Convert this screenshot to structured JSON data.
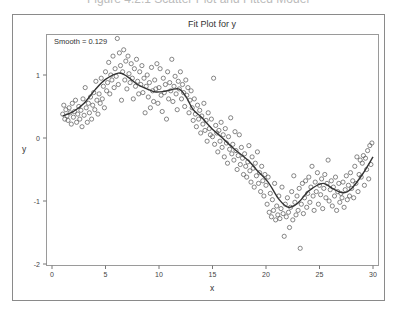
{
  "caption": "Figure 4.2.1 Scatter Plot and Fitted Model",
  "chart_data": {
    "type": "scatter",
    "title": "Fit Plot for y",
    "xlabel": "x",
    "ylabel": "y",
    "annotation": "Smooth = 0.129",
    "xlim": [
      0,
      30
    ],
    "ylim": [
      -2,
      1.6
    ],
    "xticks": [
      0,
      5,
      10,
      15,
      20,
      25,
      30
    ],
    "yticks": [
      -2,
      -1,
      0,
      1
    ],
    "grid": false,
    "legend": "none",
    "series": [
      {
        "name": "Observed",
        "type": "scatter",
        "marker": "open-circle",
        "points": [
          [
            1.0,
            0.38
          ],
          [
            1.1,
            0.52
          ],
          [
            1.2,
            0.3
          ],
          [
            1.3,
            0.45
          ],
          [
            1.4,
            0.35
          ],
          [
            1.5,
            0.28
          ],
          [
            1.6,
            0.48
          ],
          [
            1.7,
            0.4
          ],
          [
            1.8,
            0.22
          ],
          [
            1.9,
            0.55
          ],
          [
            2.0,
            0.33
          ],
          [
            2.1,
            0.42
          ],
          [
            2.2,
            0.6
          ],
          [
            2.3,
            0.25
          ],
          [
            2.4,
            0.38
          ],
          [
            2.5,
            0.5
          ],
          [
            2.6,
            0.3
          ],
          [
            2.7,
            0.44
          ],
          [
            2.8,
            0.18
          ],
          [
            2.9,
            0.62
          ],
          [
            3.0,
            0.36
          ],
          [
            3.1,
            0.8
          ],
          [
            3.2,
            0.48
          ],
          [
            3.3,
            0.25
          ],
          [
            3.4,
            0.55
          ],
          [
            3.5,
            0.4
          ],
          [
            3.6,
            0.65
          ],
          [
            3.7,
            0.3
          ],
          [
            3.8,
            0.52
          ],
          [
            3.9,
            0.72
          ],
          [
            4.0,
            0.45
          ],
          [
            4.1,
            0.9
          ],
          [
            4.2,
            0.6
          ],
          [
            4.3,
            0.38
          ],
          [
            4.4,
            0.7
          ],
          [
            4.5,
            0.55
          ],
          [
            4.6,
            0.95
          ],
          [
            4.7,
            0.62
          ],
          [
            4.8,
            0.82
          ],
          [
            4.9,
            0.48
          ],
          [
            5.0,
            1.05
          ],
          [
            5.1,
            0.75
          ],
          [
            5.2,
            0.88
          ],
          [
            5.3,
            1.2
          ],
          [
            5.4,
            0.7
          ],
          [
            5.5,
            1.0
          ],
          [
            5.6,
            0.92
          ],
          [
            5.7,
            1.3
          ],
          [
            5.8,
            0.8
          ],
          [
            5.9,
            1.1
          ],
          [
            6.0,
            0.98
          ],
          [
            6.1,
            1.58
          ],
          [
            6.2,
            0.85
          ],
          [
            6.3,
            1.35
          ],
          [
            6.4,
            1.15
          ],
          [
            6.5,
            0.6
          ],
          [
            6.6,
            1.05
          ],
          [
            6.7,
            1.4
          ],
          [
            6.8,
            0.92
          ],
          [
            6.9,
            1.22
          ],
          [
            7.0,
            0.78
          ],
          [
            7.1,
            1.3
          ],
          [
            7.2,
            1.02
          ],
          [
            7.3,
            0.88
          ],
          [
            7.4,
            1.18
          ],
          [
            7.5,
            0.95
          ],
          [
            7.6,
            0.62
          ],
          [
            7.7,
            1.1
          ],
          [
            7.8,
            0.82
          ],
          [
            7.9,
            1.25
          ],
          [
            8.0,
            0.9
          ],
          [
            8.1,
            0.7
          ],
          [
            8.2,
            1.05
          ],
          [
            8.3,
            0.85
          ],
          [
            8.4,
            1.15
          ],
          [
            8.5,
            0.72
          ],
          [
            8.6,
            0.95
          ],
          [
            8.7,
            0.4
          ],
          [
            8.8,
            0.82
          ],
          [
            8.9,
            1.0
          ],
          [
            9.0,
            0.65
          ],
          [
            9.1,
            0.88
          ],
          [
            9.2,
            0.48
          ],
          [
            9.3,
            1.12
          ],
          [
            9.4,
            0.75
          ],
          [
            9.5,
            0.58
          ],
          [
            9.6,
            0.92
          ],
          [
            9.7,
            0.78
          ],
          [
            9.8,
            1.18
          ],
          [
            9.9,
            0.55
          ],
          [
            10.0,
            0.8
          ],
          [
            10.1,
            1.1
          ],
          [
            10.2,
            0.68
          ],
          [
            10.3,
            0.42
          ],
          [
            10.4,
            0.95
          ],
          [
            10.5,
            0.72
          ],
          [
            10.6,
            0.85
          ],
          [
            10.7,
            0.3
          ],
          [
            10.8,
            1.05
          ],
          [
            10.9,
            0.62
          ],
          [
            11.0,
            0.88
          ],
          [
            11.1,
            0.75
          ],
          [
            11.2,
            1.25
          ],
          [
            11.3,
            0.58
          ],
          [
            11.4,
            0.82
          ],
          [
            11.5,
            0.98
          ],
          [
            11.6,
            0.7
          ],
          [
            11.7,
            0.45
          ],
          [
            11.8,
            0.9
          ],
          [
            11.9,
            0.78
          ],
          [
            12.0,
            1.05
          ],
          [
            12.1,
            0.62
          ],
          [
            12.2,
            0.85
          ],
          [
            12.3,
            0.72
          ],
          [
            12.4,
            0.5
          ],
          [
            12.5,
            0.92
          ],
          [
            12.6,
            0.68
          ],
          [
            12.7,
            0.8
          ],
          [
            12.8,
            0.4
          ],
          [
            12.9,
            0.6
          ],
          [
            13.0,
            0.75
          ],
          [
            13.1,
            0.48
          ],
          [
            13.2,
            0.28
          ],
          [
            13.3,
            0.62
          ],
          [
            13.4,
            0.38
          ],
          [
            13.5,
            0.18
          ],
          [
            13.6,
            0.52
          ],
          [
            13.7,
            0.3
          ],
          [
            13.8,
            0.44
          ],
          [
            13.9,
            0.08
          ],
          [
            14.0,
            0.35
          ],
          [
            14.1,
            0.22
          ],
          [
            14.2,
            0.55
          ],
          [
            14.3,
            0.12
          ],
          [
            14.4,
            0.28
          ],
          [
            14.5,
            -0.05
          ],
          [
            14.6,
            0.4
          ],
          [
            14.7,
            0.15
          ],
          [
            14.8,
            0.05
          ],
          [
            14.9,
            0.3
          ],
          [
            15.0,
            0.02
          ],
          [
            15.1,
            0.95
          ],
          [
            15.2,
            -0.1
          ],
          [
            15.3,
            0.2
          ],
          [
            15.4,
            0.08
          ],
          [
            15.5,
            -0.22
          ],
          [
            15.6,
            0.12
          ],
          [
            15.7,
            -0.05
          ],
          [
            15.8,
            0.25
          ],
          [
            15.9,
            -0.15
          ],
          [
            16.0,
            0.05
          ],
          [
            16.1,
            -0.3
          ],
          [
            16.2,
            0.15
          ],
          [
            16.3,
            -0.08
          ],
          [
            16.4,
            -0.4
          ],
          [
            16.5,
            0.02
          ],
          [
            16.6,
            -0.18
          ],
          [
            16.7,
            0.32
          ],
          [
            16.8,
            -0.25
          ],
          [
            16.9,
            -0.1
          ],
          [
            17.0,
            -0.35
          ],
          [
            17.1,
            0.1
          ],
          [
            17.2,
            -0.2
          ],
          [
            17.3,
            -0.5
          ],
          [
            17.4,
            -0.28
          ],
          [
            17.5,
            0.05
          ],
          [
            17.6,
            -0.42
          ],
          [
            17.7,
            -0.15
          ],
          [
            17.8,
            -0.32
          ],
          [
            17.9,
            -0.58
          ],
          [
            18.0,
            -0.25
          ],
          [
            18.1,
            -0.45
          ],
          [
            18.2,
            -0.62
          ],
          [
            18.3,
            -0.38
          ],
          [
            18.4,
            -0.12
          ],
          [
            18.5,
            -0.52
          ],
          [
            18.6,
            -0.7
          ],
          [
            18.7,
            -0.3
          ],
          [
            18.8,
            -0.48
          ],
          [
            18.9,
            -0.78
          ],
          [
            19.0,
            -0.4
          ],
          [
            19.1,
            -0.6
          ],
          [
            19.2,
            -0.22
          ],
          [
            19.3,
            -0.72
          ],
          [
            19.4,
            -0.55
          ],
          [
            19.5,
            -0.85
          ],
          [
            19.6,
            -0.45
          ],
          [
            19.7,
            -0.68
          ],
          [
            19.8,
            -0.92
          ],
          [
            19.9,
            -0.58
          ],
          [
            20.0,
            -0.75
          ],
          [
            20.1,
            -1.05
          ],
          [
            20.2,
            -0.62
          ],
          [
            20.3,
            -1.18
          ],
          [
            20.4,
            -0.88
          ],
          [
            20.5,
            -1.25
          ],
          [
            20.6,
            -0.98
          ],
          [
            20.7,
            -1.15
          ],
          [
            20.8,
            -0.72
          ],
          [
            20.9,
            -1.3
          ],
          [
            21.0,
            -1.08
          ],
          [
            21.1,
            -1.22
          ],
          [
            21.2,
            -0.92
          ],
          [
            21.3,
            -1.28
          ],
          [
            21.4,
            -1.12
          ],
          [
            21.5,
            -0.78
          ],
          [
            21.6,
            -1.2
          ],
          [
            21.7,
            -1.56
          ],
          [
            21.8,
            -1.05
          ],
          [
            21.9,
            -1.25
          ],
          [
            22.0,
            -0.95
          ],
          [
            22.1,
            -1.18
          ],
          [
            22.2,
            -1.42
          ],
          [
            22.3,
            -1.1
          ],
          [
            22.4,
            -0.85
          ],
          [
            22.5,
            -1.3
          ],
          [
            22.6,
            -0.6
          ],
          [
            22.7,
            -1.02
          ],
          [
            22.8,
            -1.22
          ],
          [
            22.9,
            -0.92
          ],
          [
            23.0,
            -1.15
          ],
          [
            23.1,
            -0.8
          ],
          [
            23.2,
            -1.75
          ],
          [
            23.3,
            -1.05
          ],
          [
            23.4,
            -0.72
          ],
          [
            23.5,
            -1.2
          ],
          [
            23.6,
            -0.95
          ],
          [
            23.7,
            -0.68
          ],
          [
            23.8,
            -1.1
          ],
          [
            23.9,
            -0.88
          ],
          [
            24.0,
            -0.62
          ],
          [
            24.1,
            -1.02
          ],
          [
            24.2,
            -0.78
          ],
          [
            24.3,
            -0.45
          ],
          [
            24.4,
            -0.92
          ],
          [
            24.5,
            -1.15
          ],
          [
            24.6,
            -0.7
          ],
          [
            24.7,
            -0.85
          ],
          [
            24.8,
            -0.55
          ],
          [
            24.9,
            -1.05
          ],
          [
            25.0,
            -0.75
          ],
          [
            25.1,
            -0.9
          ],
          [
            25.2,
            -0.65
          ],
          [
            25.3,
            -1.12
          ],
          [
            25.4,
            -0.8
          ],
          [
            25.5,
            -0.58
          ],
          [
            25.6,
            -0.95
          ],
          [
            25.7,
            -0.72
          ],
          [
            25.8,
            -0.35
          ],
          [
            25.9,
            -1.0
          ],
          [
            26.0,
            -0.82
          ],
          [
            26.1,
            -0.68
          ],
          [
            26.2,
            -1.08
          ],
          [
            26.3,
            -0.78
          ],
          [
            26.4,
            -0.92
          ],
          [
            26.5,
            -0.62
          ],
          [
            26.6,
            -1.15
          ],
          [
            26.7,
            -0.85
          ],
          [
            26.8,
            -0.72
          ],
          [
            26.9,
            -1.02
          ],
          [
            27.0,
            -0.88
          ],
          [
            27.1,
            -0.95
          ],
          [
            27.2,
            -0.7
          ],
          [
            27.3,
            -1.1
          ],
          [
            27.4,
            -0.82
          ],
          [
            27.5,
            -0.6
          ],
          [
            27.6,
            -0.98
          ],
          [
            27.7,
            -0.75
          ],
          [
            27.8,
            -0.92
          ],
          [
            27.9,
            -0.55
          ],
          [
            28.0,
            -0.8
          ],
          [
            28.1,
            -0.68
          ],
          [
            28.2,
            -0.95
          ],
          [
            28.3,
            -0.45
          ],
          [
            28.4,
            -0.72
          ],
          [
            28.5,
            -0.3
          ],
          [
            28.6,
            -0.85
          ],
          [
            28.7,
            -0.58
          ],
          [
            28.8,
            -0.35
          ],
          [
            28.9,
            -0.62
          ],
          [
            29.0,
            -0.4
          ],
          [
            29.1,
            -0.28
          ],
          [
            29.2,
            -0.75
          ],
          [
            29.3,
            -0.32
          ],
          [
            29.4,
            -0.5
          ],
          [
            29.5,
            -0.2
          ],
          [
            29.6,
            -0.65
          ],
          [
            29.7,
            -0.12
          ],
          [
            29.8,
            -0.42
          ],
          [
            29.9,
            -0.08
          ]
        ]
      },
      {
        "name": "Loess fit",
        "type": "line",
        "points": [
          [
            1.0,
            0.35
          ],
          [
            2.0,
            0.42
          ],
          [
            3.0,
            0.55
          ],
          [
            4.0,
            0.76
          ],
          [
            5.0,
            0.93
          ],
          [
            6.2,
            1.03
          ],
          [
            7.0,
            0.98
          ],
          [
            8.0,
            0.85
          ],
          [
            9.0,
            0.77
          ],
          [
            9.7,
            0.73
          ],
          [
            10.5,
            0.74
          ],
          [
            11.8,
            0.78
          ],
          [
            12.5,
            0.66
          ],
          [
            13.2,
            0.45
          ],
          [
            13.9,
            0.34
          ],
          [
            15.0,
            0.14
          ],
          [
            15.8,
            0.02
          ],
          [
            17.0,
            -0.17
          ],
          [
            18.3,
            -0.35
          ],
          [
            19.2,
            -0.52
          ],
          [
            20.2,
            -0.7
          ],
          [
            21.2,
            -0.97
          ],
          [
            22.1,
            -1.1
          ],
          [
            23.0,
            -1.03
          ],
          [
            24.0,
            -0.84
          ],
          [
            25.3,
            -0.72
          ],
          [
            26.2,
            -0.8
          ],
          [
            27.2,
            -0.87
          ],
          [
            28.0,
            -0.8
          ],
          [
            29.0,
            -0.58
          ],
          [
            30.0,
            -0.3
          ]
        ]
      }
    ]
  }
}
